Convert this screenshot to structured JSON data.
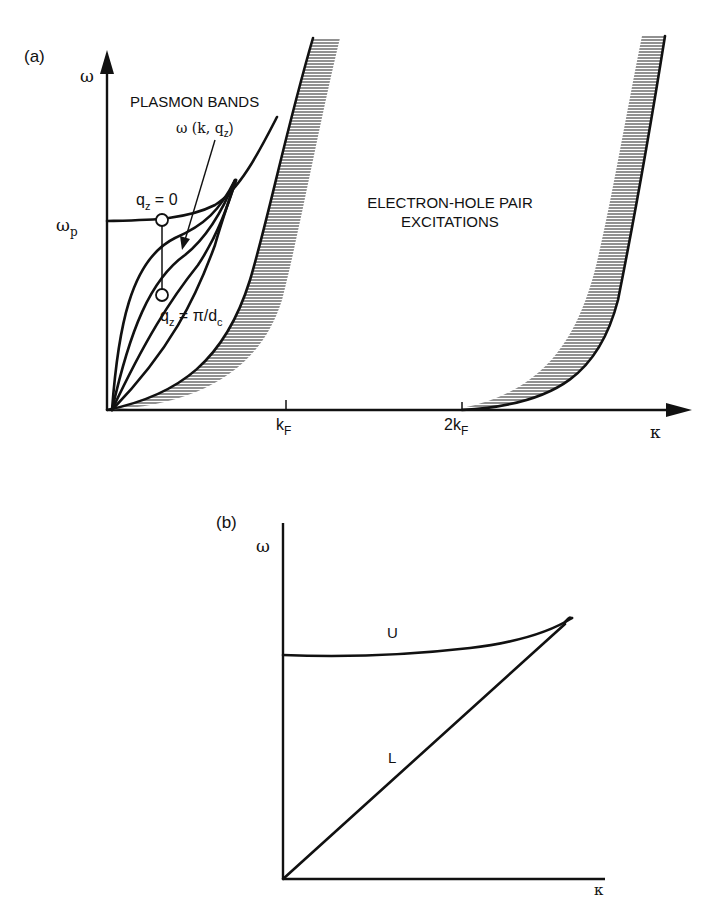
{
  "panel_a": {
    "label": "(a)",
    "y_axis_label": "ω",
    "x_axis_label": "κ",
    "omega_p_label": "ω",
    "omega_p_sub": "p",
    "title_bands": "PLASMON BANDS",
    "dispersion_label_main": "ω (k, q",
    "dispersion_label_sub": "z",
    "dispersion_label_end": ")",
    "qz0_label_main": "q",
    "qz0_label_sub": "z",
    "qz0_label_end": " = 0",
    "qzpi_label_main": "q",
    "qzpi_label_sub": "z",
    "qzpi_label_mid": " = π/d",
    "qzpi_label_sub2": "c",
    "eh_line1": "ELECTRON-HOLE PAIR",
    "eh_line2": "EXCITATIONS",
    "tick_kf_main": "k",
    "tick_kf_sub": "F",
    "tick_2kf_main": "2k",
    "tick_2kf_sub": "F"
  },
  "panel_b": {
    "label": "(b)",
    "y_axis_label": "ω",
    "x_axis_label": "κ",
    "upper_branch_label": "U",
    "lower_branch_label": "L"
  }
}
